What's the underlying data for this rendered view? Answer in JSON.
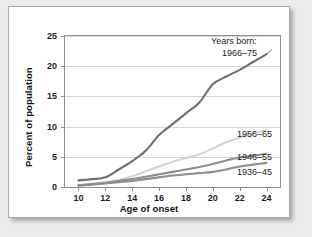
{
  "chart_data": {
    "type": "line",
    "title": "",
    "xlabel": "Age of onset",
    "ylabel": "Percent of population",
    "xlim": [
      9,
      25
    ],
    "ylim": [
      0,
      25
    ],
    "xticks": [
      10,
      12,
      14,
      16,
      18,
      20,
      22,
      24
    ],
    "yticks": [
      0,
      5,
      10,
      15,
      20,
      25
    ],
    "grid": true,
    "legend_position": "inline-right",
    "legend_heading": "Years born:",
    "x": [
      10,
      11,
      12,
      13,
      14,
      15,
      16,
      17,
      18,
      19,
      20,
      21,
      22,
      23,
      24
    ],
    "series": [
      {
        "name": "1966–75",
        "color": "#6f6f6f",
        "values": [
          1.1,
          1.3,
          1.6,
          2.9,
          4.3,
          6.0,
          8.6,
          10.4,
          12.2,
          14.0,
          17.0,
          18.3,
          19.4,
          20.7,
          22.0
        ],
        "label_x": 24,
        "label_y": 22.0
      },
      {
        "name": "1956–65",
        "color": "#d4d4d4",
        "values": [
          0.3,
          0.5,
          0.8,
          1.2,
          1.8,
          2.6,
          3.4,
          4.2,
          4.8,
          5.4,
          6.4,
          7.4,
          8.2,
          8.9,
          9.4
        ],
        "label_x": 24,
        "label_y": 9.4
      },
      {
        "name": "1946–55",
        "color": "#8d8d8d",
        "values": [
          0.3,
          0.5,
          0.7,
          1.0,
          1.3,
          1.7,
          2.1,
          2.5,
          2.9,
          3.3,
          3.8,
          4.4,
          4.9,
          5.2,
          5.5
        ],
        "label_x": 24,
        "label_y": 5.5
      },
      {
        "name": "1936–45",
        "color": "#8d8d8d",
        "values": [
          0.2,
          0.4,
          0.6,
          0.8,
          1.0,
          1.3,
          1.6,
          1.9,
          2.1,
          2.3,
          2.5,
          2.9,
          3.4,
          3.7,
          4.0
        ],
        "label_x": 24,
        "label_y": 4.0
      }
    ],
    "series_labels": [
      {
        "text": "Years born:",
        "top": 29,
        "left": 202
      },
      {
        "text": "1966–75",
        "top": 41,
        "left": 213
      },
      {
        "text": "1956–65",
        "top": 122,
        "left": 228
      },
      {
        "text": "1946–55",
        "top": 145,
        "left": 228
      },
      {
        "text": "1936–45",
        "top": 160,
        "left": 228
      }
    ]
  }
}
